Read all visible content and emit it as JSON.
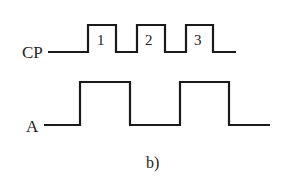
{
  "diagram": {
    "caption": "b)",
    "signals": [
      {
        "name": "CP",
        "pulse_labels": [
          "1",
          "2",
          "3"
        ]
      },
      {
        "name": "A"
      }
    ],
    "stroke_color": "#1a1a1a"
  }
}
